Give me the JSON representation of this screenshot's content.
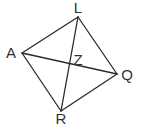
{
  "figure": {
    "type": "quadrilateral-with-diagonals",
    "vertices": [
      {
        "id": "L",
        "label": "L",
        "x": 78,
        "y": 17,
        "lx": 78,
        "ly": 13
      },
      {
        "id": "A",
        "label": "A",
        "x": 22,
        "y": 53,
        "lx": 11,
        "ly": 58
      },
      {
        "id": "Q",
        "label": "Q",
        "x": 117,
        "y": 74,
        "lx": 127,
        "ly": 80
      },
      {
        "id": "R",
        "label": "R",
        "x": 61,
        "y": 111,
        "lx": 61,
        "ly": 124
      }
    ],
    "intersection": {
      "label": "Z",
      "lx": 78,
      "ly": 65
    },
    "sides": [
      [
        "L",
        "Q"
      ],
      [
        "Q",
        "R"
      ],
      [
        "R",
        "A"
      ],
      [
        "A",
        "L"
      ]
    ],
    "diagonals": [
      [
        "L",
        "R"
      ],
      [
        "A",
        "Q"
      ]
    ],
    "line_color": "#2a2a2a",
    "label_color": "#333333"
  }
}
